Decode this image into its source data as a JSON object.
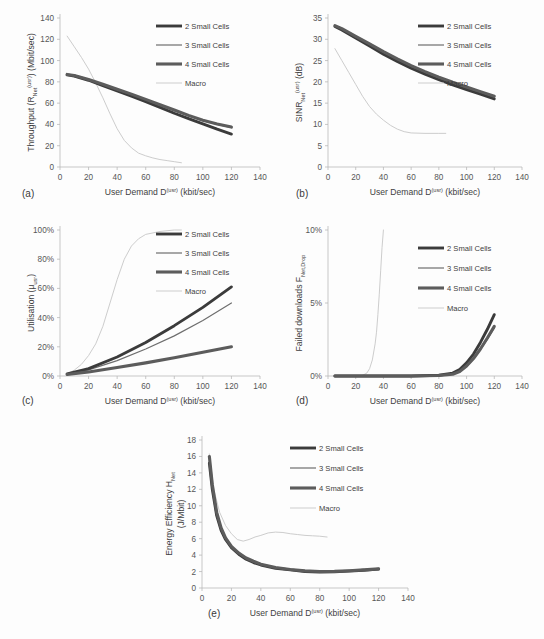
{
  "figure": {
    "background": "#fdfdfd",
    "panel_tags": [
      "(a)",
      "(b)",
      "(c)",
      "(d)",
      "(e)"
    ]
  },
  "legend": {
    "entries": [
      {
        "label": "2 Small  Cells",
        "color": "#3b3b3b",
        "width": 2.9
      },
      {
        "label": "3 Small Cells",
        "color": "#6e6e6e",
        "width": 1.2
      },
      {
        "label": "4 Small Cells",
        "color": "#5c5c5c",
        "width": 3.1
      },
      {
        "label": "Macro",
        "color": "#cdcdcd",
        "width": 1.0
      }
    ]
  },
  "shared": {
    "xlabel_main": "User Demand D",
    "xlabel_sup": "(usr)",
    "xlabel_units": " (kbit/sec)",
    "xticks": [
      0,
      20,
      40,
      60,
      80,
      100,
      120,
      140
    ],
    "xlim": [
      0,
      140
    ]
  },
  "chart_data": [
    {
      "id": "a",
      "type": "line",
      "tag": "(a)",
      "title": "",
      "ylabel_parts": {
        "main": "Throughput (R",
        "sub": "Net",
        "sup": "(usr)",
        "tail": ") (Mbit/sec)"
      },
      "xlabel": "User Demand D(usr) (kbit/sec)",
      "ylabel": "Throughput (R_Net^(usr)) (Mbit/sec)",
      "xlim": [
        0,
        140
      ],
      "ylim": [
        0,
        140
      ],
      "xticks": [
        0,
        20,
        40,
        60,
        80,
        100,
        120,
        140
      ],
      "yticks": [
        0,
        20,
        40,
        60,
        80,
        100,
        120,
        140
      ],
      "grid": false,
      "legend_position": "top-right",
      "series": [
        {
          "name": "2 Small  Cells",
          "color": "#3b3b3b",
          "width": 2.9,
          "x": [
            5,
            10,
            20,
            30,
            40,
            50,
            60,
            70,
            80,
            90,
            100,
            110,
            120
          ],
          "y": [
            86.5,
            85.5,
            81.5,
            76.5,
            71.5,
            66.5,
            61.5,
            56.0,
            50.5,
            45.5,
            40.5,
            35.5,
            31.0
          ]
        },
        {
          "name": "3 Small Cells",
          "color": "#6e6e6e",
          "width": 1.2,
          "x": [
            5,
            10,
            20,
            30,
            40,
            50,
            60,
            70,
            80,
            90,
            100,
            110,
            120
          ],
          "y": [
            86.8,
            85.8,
            82.0,
            77.5,
            72.5,
            68.0,
            63.0,
            58.0,
            53.0,
            48.0,
            43.5,
            40.0,
            37.0
          ]
        },
        {
          "name": "4 Small Cells",
          "color": "#5c5c5c",
          "width": 3.1,
          "x": [
            5,
            10,
            20,
            30,
            40,
            50,
            60,
            70,
            80,
            90,
            100,
            110,
            120
          ],
          "y": [
            87.0,
            86.0,
            82.2,
            77.8,
            73.0,
            68.5,
            63.5,
            58.5,
            53.5,
            48.5,
            44.0,
            40.5,
            37.5
          ]
        },
        {
          "name": "Macro",
          "color": "#cdcdcd",
          "width": 1.0,
          "x": [
            5,
            10,
            15,
            20,
            25,
            30,
            35,
            40,
            45,
            50,
            55,
            60,
            65,
            70,
            75,
            80,
            85
          ],
          "y": [
            123,
            113,
            103,
            92,
            79,
            65,
            50,
            36,
            25,
            18,
            13,
            10.5,
            8.5,
            7,
            6,
            5,
            4
          ]
        }
      ]
    },
    {
      "id": "b",
      "type": "line",
      "tag": "(b)",
      "ylabel_parts": {
        "main": "SINR",
        "sub": "Net",
        "sup": "(usr)",
        "tail": " (dB)"
      },
      "xlabel": "User Demand D(usr) (kbit/sec)",
      "ylabel": "SINR_Net^(usr) (dB)",
      "xlim": [
        0,
        140
      ],
      "ylim": [
        0,
        35
      ],
      "xticks": [
        0,
        20,
        40,
        60,
        80,
        100,
        120,
        140
      ],
      "yticks": [
        0,
        5,
        10,
        15,
        20,
        25,
        30,
        35
      ],
      "grid": false,
      "legend_position": "top-right",
      "series": [
        {
          "name": "2 Small  Cells",
          "color": "#3b3b3b",
          "width": 2.9,
          "x": [
            5,
            10,
            20,
            30,
            40,
            50,
            60,
            70,
            80,
            90,
            100,
            110,
            120
          ],
          "y": [
            33.0,
            32.2,
            30.3,
            28.4,
            26.5,
            24.8,
            23.2,
            21.8,
            20.5,
            19.3,
            18.2,
            17.1,
            16.0
          ]
        },
        {
          "name": "3 Small Cells",
          "color": "#6e6e6e",
          "width": 1.2,
          "x": [
            5,
            10,
            20,
            30,
            40,
            50,
            60,
            70,
            80,
            90,
            100,
            110,
            120
          ],
          "y": [
            33.1,
            32.4,
            30.5,
            28.7,
            26.9,
            25.2,
            23.6,
            22.2,
            20.9,
            19.7,
            18.6,
            17.5,
            16.4
          ]
        },
        {
          "name": "4 Small Cells",
          "color": "#5c5c5c",
          "width": 3.1,
          "x": [
            5,
            10,
            20,
            30,
            40,
            50,
            60,
            70,
            80,
            90,
            100,
            110,
            120
          ],
          "y": [
            33.2,
            32.5,
            30.7,
            28.9,
            27.1,
            25.4,
            23.8,
            22.4,
            21.1,
            19.9,
            18.8,
            17.7,
            16.6
          ]
        },
        {
          "name": "Macro",
          "color": "#cdcdcd",
          "width": 1.0,
          "x": [
            5,
            10,
            15,
            20,
            25,
            30,
            35,
            40,
            45,
            50,
            55,
            60,
            70,
            80,
            85
          ],
          "y": [
            27.8,
            25.0,
            22.2,
            19.4,
            16.6,
            14.2,
            12.4,
            11.0,
            9.8,
            8.9,
            8.3,
            8.0,
            7.9,
            7.9,
            7.9
          ]
        }
      ]
    },
    {
      "id": "c",
      "type": "line",
      "tag": "(c)",
      "ylabel_parts": {
        "main": "Utilisation (μ",
        "sub": "usr",
        "sup": "",
        "tail": ")"
      },
      "xlabel": "User Demand D(usr) (kbit/sec)",
      "ylabel": "Utilisation (μ_usr)",
      "xlim": [
        0,
        140
      ],
      "ylim": [
        0,
        100
      ],
      "xticks": [
        0,
        20,
        40,
        60,
        80,
        100,
        120,
        140
      ],
      "yticks": [
        0,
        20,
        40,
        60,
        80,
        100
      ],
      "ytick_labels": [
        "0%",
        "20%",
        "40%",
        "60%",
        "80%",
        "100%"
      ],
      "grid": false,
      "legend_position": "top-right",
      "series": [
        {
          "name": "2 Small  Cells",
          "color": "#3b3b3b",
          "width": 2.9,
          "x": [
            5,
            20,
            40,
            60,
            80,
            100,
            120
          ],
          "y": [
            1.5,
            5.0,
            13.0,
            23.0,
            34.5,
            47.0,
            61.0
          ]
        },
        {
          "name": "3 Small Cells",
          "color": "#6e6e6e",
          "width": 1.2,
          "x": [
            5,
            20,
            40,
            60,
            80,
            100,
            120
          ],
          "y": [
            1.3,
            4.2,
            10.5,
            18.5,
            27.5,
            38.0,
            50.0
          ]
        },
        {
          "name": "4 Small Cells",
          "color": "#5c5c5c",
          "width": 3.1,
          "x": [
            5,
            20,
            40,
            60,
            80,
            100,
            120
          ],
          "y": [
            1.0,
            2.8,
            5.8,
            9.0,
            12.5,
            16.2,
            20.0
          ]
        },
        {
          "name": "Macro",
          "color": "#cdcdcd",
          "width": 1.0,
          "x": [
            5,
            10,
            15,
            20,
            25,
            30,
            35,
            40,
            45,
            50,
            55,
            60,
            70,
            80,
            85
          ],
          "y": [
            1.5,
            4.0,
            8.0,
            14.0,
            22.0,
            34.0,
            50.0,
            66.0,
            80.0,
            89.0,
            94.0,
            97.0,
            99.0,
            100.0,
            100.0
          ]
        }
      ]
    },
    {
      "id": "d",
      "type": "line",
      "tag": "(d)",
      "ylabel_parts": {
        "main": "Failed downloads F",
        "sub": "Net,Drop",
        "sup": "",
        "tail": ""
      },
      "xlabel": "User Demand D(usr) (kbit/sec)",
      "ylabel": "Failed downloads F_Net,Drop",
      "xlim": [
        0,
        140
      ],
      "ylim": [
        0,
        10
      ],
      "xticks": [
        0,
        20,
        40,
        60,
        80,
        100,
        120,
        140
      ],
      "yticks": [
        0,
        5,
        10
      ],
      "ytick_labels": [
        "0%",
        "5%",
        "10%"
      ],
      "grid": false,
      "legend_position": "top-right",
      "series": [
        {
          "name": "2 Small  Cells",
          "color": "#3b3b3b",
          "width": 2.9,
          "x": [
            5,
            20,
            40,
            60,
            80,
            90,
            95,
            100,
            105,
            110,
            115,
            120
          ],
          "y": [
            0.0,
            0.0,
            0.0,
            0.0,
            0.05,
            0.2,
            0.45,
            0.9,
            1.5,
            2.3,
            3.2,
            4.2
          ]
        },
        {
          "name": "3 Small Cells",
          "color": "#6e6e6e",
          "width": 1.2,
          "x": [
            5,
            20,
            40,
            60,
            80,
            90,
            95,
            100,
            105,
            110,
            115,
            120
          ],
          "y": [
            0.0,
            0.0,
            0.0,
            0.0,
            0.03,
            0.12,
            0.3,
            0.65,
            1.15,
            1.8,
            2.5,
            3.3
          ]
        },
        {
          "name": "4 Small Cells",
          "color": "#5c5c5c",
          "width": 3.1,
          "x": [
            5,
            20,
            40,
            60,
            80,
            90,
            95,
            100,
            105,
            110,
            115,
            120
          ],
          "y": [
            0.0,
            0.0,
            0.0,
            0.0,
            0.03,
            0.12,
            0.3,
            0.68,
            1.2,
            1.85,
            2.6,
            3.4
          ]
        },
        {
          "name": "Macro",
          "color": "#cdcdcd",
          "width": 1.0,
          "x": [
            22,
            25,
            28,
            30,
            32,
            34,
            35,
            36,
            37,
            38,
            39,
            40
          ],
          "y": [
            0.0,
            0.05,
            0.2,
            0.5,
            1.1,
            2.2,
            3.0,
            4.2,
            5.6,
            7.2,
            8.8,
            10.0
          ]
        }
      ]
    },
    {
      "id": "e",
      "type": "line",
      "tag": "(e)",
      "ylabel_parts": {
        "main": "Energy Efficiency H",
        "sub": "Net",
        "sup": "",
        "tail": ""
      },
      "ylabel_line2": "(J/Mbit)",
      "xlabel": "User Demand D(usr) (kbit/sec)",
      "ylabel": "Energy Efficiency H_Net (J/Mbit)",
      "xlim": [
        0,
        140
      ],
      "ylim": [
        0,
        18
      ],
      "xticks": [
        0,
        20,
        40,
        60,
        80,
        100,
        120,
        140
      ],
      "yticks": [
        0,
        2,
        4,
        6,
        8,
        10,
        12,
        14,
        16,
        18
      ],
      "grid": false,
      "legend_position": "top-right",
      "series": [
        {
          "name": "2 Small  Cells",
          "color": "#3b3b3b",
          "width": 2.9,
          "x": [
            5,
            7,
            10,
            13,
            16,
            20,
            25,
            30,
            35,
            40,
            50,
            60,
            70,
            80,
            90,
            100,
            110,
            120
          ],
          "y": [
            15.2,
            12.0,
            8.8,
            7.0,
            5.9,
            4.9,
            4.1,
            3.5,
            3.1,
            2.8,
            2.4,
            2.2,
            2.0,
            1.95,
            1.98,
            2.05,
            2.15,
            2.3
          ]
        },
        {
          "name": "3 Small Cells",
          "color": "#6e6e6e",
          "width": 1.2,
          "x": [
            5,
            7,
            10,
            13,
            16,
            20,
            25,
            30,
            35,
            40,
            50,
            60,
            70,
            80,
            90,
            100,
            110,
            120
          ],
          "y": [
            15.6,
            12.3,
            9.0,
            7.1,
            6.0,
            5.0,
            4.2,
            3.6,
            3.2,
            2.85,
            2.45,
            2.2,
            2.05,
            1.98,
            2.0,
            2.08,
            2.18,
            2.3
          ]
        },
        {
          "name": "4 Small Cells",
          "color": "#5c5c5c",
          "width": 3.1,
          "x": [
            5,
            7,
            10,
            13,
            16,
            20,
            25,
            30,
            35,
            40,
            50,
            60,
            70,
            80,
            90,
            100,
            110,
            120
          ],
          "y": [
            16.0,
            12.6,
            9.2,
            7.3,
            6.1,
            5.05,
            4.25,
            3.65,
            3.25,
            2.9,
            2.5,
            2.25,
            2.08,
            2.0,
            2.02,
            2.1,
            2.2,
            2.32
          ]
        },
        {
          "name": "Macro",
          "color": "#cdcdcd",
          "width": 1.0,
          "x": [
            5,
            8,
            12,
            16,
            20,
            24,
            28,
            32,
            36,
            40,
            45,
            50,
            55,
            60,
            65,
            70,
            75,
            80,
            85
          ],
          "y": [
            16.3,
            12.0,
            9.2,
            7.6,
            6.6,
            5.9,
            5.7,
            5.9,
            6.2,
            6.4,
            6.7,
            6.8,
            6.75,
            6.6,
            6.5,
            6.4,
            6.35,
            6.3,
            6.2
          ]
        }
      ]
    }
  ]
}
